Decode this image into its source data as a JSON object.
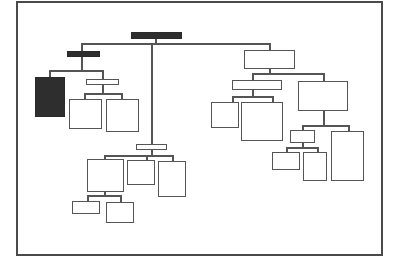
{
  "diagram": {
    "type": "org-chart",
    "frame": {
      "x": 16,
      "y": 1,
      "w": 365,
      "h": 253,
      "color": "#4a4a4a"
    },
    "colors": {
      "line": "#555555",
      "dark_node": "#2e2e2e",
      "light_node": "#ffffff"
    },
    "nodes": [
      {
        "id": "root",
        "x": 131,
        "y": 32,
        "w": 51,
        "h": 7,
        "style": "dark"
      },
      {
        "id": "left-head",
        "x": 67,
        "y": 51,
        "w": 33,
        "h": 6,
        "style": "dark"
      },
      {
        "id": "left-tall",
        "x": 35,
        "y": 77,
        "w": 30,
        "h": 40,
        "style": "dark"
      },
      {
        "id": "left-mid",
        "x": 86,
        "y": 79,
        "w": 33,
        "h": 6,
        "style": "light"
      },
      {
        "id": "left-box-a",
        "x": 69,
        "y": 99,
        "w": 33,
        "h": 30,
        "style": "light"
      },
      {
        "id": "left-box-b",
        "x": 106,
        "y": 99,
        "w": 33,
        "h": 33,
        "style": "light"
      },
      {
        "id": "center-head",
        "x": 136,
        "y": 144,
        "w": 31,
        "h": 6,
        "style": "light"
      },
      {
        "id": "center-box-a",
        "x": 87,
        "y": 159,
        "w": 37,
        "h": 33,
        "style": "light"
      },
      {
        "id": "center-box-b",
        "x": 127,
        "y": 160,
        "w": 28,
        "h": 25,
        "style": "light"
      },
      {
        "id": "center-box-c",
        "x": 158,
        "y": 161,
        "w": 28,
        "h": 36,
        "style": "light"
      },
      {
        "id": "center-sub-a",
        "x": 72,
        "y": 201,
        "w": 28,
        "h": 13,
        "style": "light"
      },
      {
        "id": "center-sub-b",
        "x": 106,
        "y": 202,
        "w": 28,
        "h": 21,
        "style": "light"
      },
      {
        "id": "right-head",
        "x": 244,
        "y": 50,
        "w": 51,
        "h": 19,
        "style": "light"
      },
      {
        "id": "right-mid",
        "x": 232,
        "y": 80,
        "w": 50,
        "h": 10,
        "style": "light"
      },
      {
        "id": "right-box-a",
        "x": 211,
        "y": 102,
        "w": 28,
        "h": 26,
        "style": "light"
      },
      {
        "id": "right-box-b",
        "x": 241,
        "y": 102,
        "w": 42,
        "h": 39,
        "style": "light"
      },
      {
        "id": "right-big",
        "x": 298,
        "y": 81,
        "w": 50,
        "h": 30,
        "style": "light"
      },
      {
        "id": "right-small",
        "x": 290,
        "y": 130,
        "w": 25,
        "h": 13,
        "style": "light"
      },
      {
        "id": "right-sub-a",
        "x": 272,
        "y": 152,
        "w": 28,
        "h": 18,
        "style": "light"
      },
      {
        "id": "right-sub-b",
        "x": 303,
        "y": 152,
        "w": 24,
        "h": 29,
        "style": "light"
      },
      {
        "id": "right-tall",
        "x": 331,
        "y": 131,
        "w": 33,
        "h": 50,
        "style": "light"
      }
    ],
    "lines": [
      {
        "x": 155,
        "y": 38,
        "w": 1.5,
        "h": 6
      },
      {
        "x": 81,
        "y": 43,
        "w": 189,
        "h": 1.5
      },
      {
        "x": 81,
        "y": 43,
        "w": 1.5,
        "h": 8
      },
      {
        "x": 269,
        "y": 43,
        "w": 1.5,
        "h": 7
      },
      {
        "x": 151,
        "y": 43,
        "w": 1.5,
        "h": 101
      },
      {
        "x": 81,
        "y": 57,
        "w": 1.5,
        "h": 13
      },
      {
        "x": 49,
        "y": 70,
        "w": 54,
        "h": 1.5
      },
      {
        "x": 49,
        "y": 70,
        "w": 1.5,
        "h": 7
      },
      {
        "x": 102,
        "y": 70,
        "w": 1.5,
        "h": 9
      },
      {
        "x": 102,
        "y": 85,
        "w": 1.5,
        "h": 8
      },
      {
        "x": 84,
        "y": 93,
        "w": 38,
        "h": 1.5
      },
      {
        "x": 84,
        "y": 93,
        "w": 1.5,
        "h": 6
      },
      {
        "x": 121,
        "y": 93,
        "w": 1.5,
        "h": 6
      },
      {
        "x": 151,
        "y": 150,
        "w": 1.5,
        "h": 5
      },
      {
        "x": 104,
        "y": 155,
        "w": 69,
        "h": 1.5
      },
      {
        "x": 104,
        "y": 155,
        "w": 1.5,
        "h": 4
      },
      {
        "x": 146,
        "y": 155,
        "w": 1.5,
        "h": 5
      },
      {
        "x": 172,
        "y": 155,
        "w": 1.5,
        "h": 6
      },
      {
        "x": 104,
        "y": 192,
        "w": 1.5,
        "h": 3
      },
      {
        "x": 87,
        "y": 195,
        "w": 34,
        "h": 1.5
      },
      {
        "x": 87,
        "y": 195,
        "w": 1.5,
        "h": 6
      },
      {
        "x": 120,
        "y": 195,
        "w": 1.5,
        "h": 7
      },
      {
        "x": 269,
        "y": 69,
        "w": 1.5,
        "h": 4
      },
      {
        "x": 252,
        "y": 73,
        "w": 72,
        "h": 1.5
      },
      {
        "x": 252,
        "y": 73,
        "w": 1.5,
        "h": 7
      },
      {
        "x": 323,
        "y": 73,
        "w": 1.5,
        "h": 8
      },
      {
        "x": 252,
        "y": 90,
        "w": 1.5,
        "h": 6
      },
      {
        "x": 232,
        "y": 96,
        "w": 41,
        "h": 1.5
      },
      {
        "x": 232,
        "y": 96,
        "w": 1.5,
        "h": 6
      },
      {
        "x": 272,
        "y": 96,
        "w": 1.5,
        "h": 6
      },
      {
        "x": 323,
        "y": 111,
        "w": 1.5,
        "h": 14
      },
      {
        "x": 302,
        "y": 125,
        "w": 47,
        "h": 1.5
      },
      {
        "x": 302,
        "y": 125,
        "w": 1.5,
        "h": 5
      },
      {
        "x": 348,
        "y": 125,
        "w": 1.5,
        "h": 6
      },
      {
        "x": 302,
        "y": 143,
        "w": 1.5,
        "h": 4
      },
      {
        "x": 286,
        "y": 147,
        "w": 32,
        "h": 1.5
      },
      {
        "x": 286,
        "y": 147,
        "w": 1.5,
        "h": 5
      },
      {
        "x": 317,
        "y": 147,
        "w": 1.5,
        "h": 5
      }
    ]
  }
}
